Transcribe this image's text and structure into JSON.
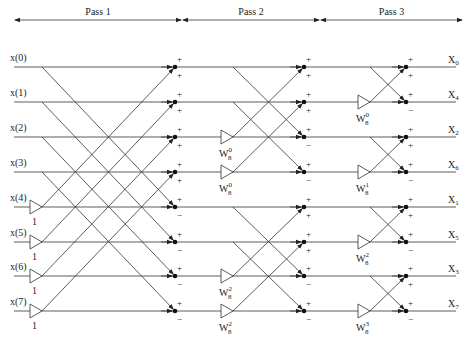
{
  "passes": [
    {
      "label": "Pass 1",
      "x1": 14,
      "x2": 182
    },
    {
      "label": "Pass 2",
      "x1": 182,
      "x2": 320
    },
    {
      "label": "Pass 3",
      "x1": 320,
      "x2": 463
    }
  ],
  "inputs": [
    "x(0)",
    "x(1)",
    "x(2)",
    "x(3)",
    "x(4)",
    "x(5)",
    "x(6)",
    "x(7)"
  ],
  "outputs": [
    {
      "name": "X",
      "sub": "0"
    },
    {
      "name": "X",
      "sub": "4"
    },
    {
      "name": "X",
      "sub": "2"
    },
    {
      "name": "X",
      "sub": "6"
    },
    {
      "name": "X",
      "sub": "1"
    },
    {
      "name": "X",
      "sub": "5"
    },
    {
      "name": "X",
      "sub": "3"
    },
    {
      "name": "X",
      "sub": "7"
    }
  ],
  "rows_y": [
    67,
    102,
    137,
    172,
    207,
    242,
    276,
    311
  ],
  "pass1": {
    "multipliers": [
      {
        "row": 4,
        "label": "1"
      },
      {
        "row": 5,
        "label": "1"
      },
      {
        "row": 6,
        "label": "1"
      },
      {
        "row": 7,
        "label": "1"
      }
    ],
    "signs": [
      "+",
      "+",
      "+",
      "+",
      "-",
      "-",
      "-",
      "-"
    ]
  },
  "pass2": {
    "multipliers": [
      {
        "row": 2,
        "base": "W",
        "sub": "8",
        "sup": "0"
      },
      {
        "row": 3,
        "base": "W",
        "sub": "8",
        "sup": "0"
      },
      {
        "row": 6,
        "base": "W",
        "sub": "8",
        "sup": "2"
      },
      {
        "row": 7,
        "base": "W",
        "sub": "8",
        "sup": "2"
      }
    ]
  },
  "pass3": {
    "multipliers": [
      {
        "row": 1,
        "base": "W",
        "sub": "8",
        "sup": "0"
      },
      {
        "row": 3,
        "base": "W",
        "sub": "8",
        "sup": "1"
      },
      {
        "row": 5,
        "base": "W",
        "sub": "8",
        "sup": "2"
      },
      {
        "row": 7,
        "base": "W",
        "sub": "8",
        "sup": "3"
      }
    ]
  },
  "node_sign_plus": "+",
  "node_sign_minus": "−"
}
